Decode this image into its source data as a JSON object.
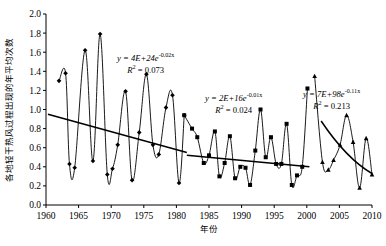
{
  "chart_data": {
    "type": "line",
    "title": "",
    "xlabel": "年份",
    "ylabel": "各地轻干热风过程出现的年平均次数",
    "xlim": [
      1960,
      2010
    ],
    "ylim": [
      0.0,
      2.0
    ],
    "grid": false,
    "legend": "none",
    "xticks": [
      1960,
      1965,
      1970,
      1975,
      1980,
      1985,
      1990,
      1995,
      2000,
      2005,
      2010
    ],
    "yticks": [
      "0.0",
      "0.2",
      "0.4",
      "0.6",
      "0.8",
      "1.0",
      "1.2",
      "1.4",
      "1.6",
      "1.8",
      "2.0"
    ],
    "series": [
      {
        "name": "1962-1981",
        "marker": "diamond",
        "x": [
          1962,
          1963,
          1963.6,
          1964.4,
          1966,
          1967.2,
          1968.3,
          1969.4,
          1970.2,
          1971,
          1972.2,
          1973.2,
          1974.3,
          1975.4,
          1976.4,
          1977.3,
          1978.4,
          1979.4,
          1980.4,
          1981.2
        ],
        "y": [
          1.3,
          1.38,
          0.43,
          0.39,
          1.62,
          0.46,
          1.79,
          0.32,
          0.38,
          0.63,
          1.19,
          0.26,
          0.76,
          1.37,
          0.63,
          0.53,
          1.02,
          1.15,
          0.23,
          0.94
        ]
      },
      {
        "name": "1981-2000",
        "marker": "square",
        "x": [
          1981.2,
          1982.4,
          1983.2,
          1984.2,
          1985,
          1985.9,
          1986.6,
          1987.4,
          1988.2,
          1989,
          1989.8,
          1990.6,
          1991.3,
          1992.1,
          1992.9,
          1993.7,
          1994.5,
          1995.3,
          1996.1,
          1996.9,
          1997.7,
          1998.5,
          1999.3,
          2000.1
        ],
        "y": [
          0.94,
          0.8,
          0.71,
          0.44,
          0.52,
          0.77,
          0.3,
          0.44,
          0.72,
          0.28,
          0.4,
          0.39,
          0.21,
          0.57,
          1.0,
          0.5,
          0.71,
          0.43,
          0.43,
          0.85,
          0.21,
          0.31,
          0.4,
          1.22
        ]
      },
      {
        "name": "2001-2010",
        "marker": "triangle",
        "x": [
          2001.2,
          2002.4,
          2003.3,
          2004.1,
          2005.1,
          2006.1,
          2007.1,
          2008.1,
          2009.1,
          2010
        ],
        "y": [
          1.35,
          0.45,
          0.37,
          0.47,
          0.63,
          0.94,
          0.66,
          0.18,
          0.7,
          0.32
        ]
      }
    ],
    "trend_lines": [
      {
        "name": "trend-1960-1981",
        "equation": "y = 4E+24e",
        "exponent": "-0.02x",
        "r2_label": "R",
        "r2_value": " = 0.073",
        "x_start": 1960.3,
        "x_end": 1981.6,
        "y_start": 0.95,
        "y_end": 0.55
      },
      {
        "name": "trend-1981-2000",
        "equation": "y = 2E+16e",
        "exponent": "-0.01x",
        "r2_label": "R",
        "r2_value": " = 0.024",
        "x_start": 1981.6,
        "x_end": 2000.4,
        "y_start": 0.52,
        "y_end": 0.4
      },
      {
        "name": "trend-2001-2010",
        "equation": "y = 7E+98e",
        "exponent": "-0.11x",
        "r2_label": "R",
        "r2_value": " = 0.213",
        "x_start": 2002.2,
        "x_end": 2010,
        "y_start": 0.88,
        "y_end": 0.33
      }
    ]
  },
  "axes": {
    "y_label": "各地轻干热风过程出现的年平均次数",
    "x_label": "年份"
  },
  "colors": {
    "axis": "#000000",
    "line": "#000000",
    "trend": "#000000",
    "background": "#ffffff"
  }
}
